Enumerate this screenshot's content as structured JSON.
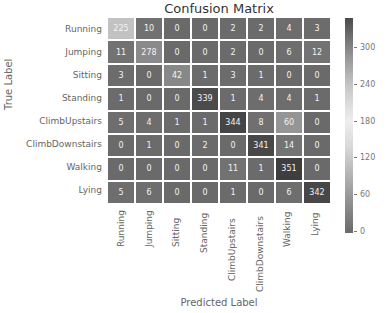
{
  "chart_data": {
    "type": "heatmap",
    "title": "Confusion Matrix",
    "xlabel": "Predicted Label",
    "ylabel": "True Label",
    "row_labels": [
      "Running",
      "Jumping",
      "Sitting",
      "Standing",
      "ClimbUpstairs",
      "ClimbDownstairs",
      "Walking",
      "Lying"
    ],
    "col_labels": [
      "Running",
      "Jumping",
      "Sitting",
      "Standing",
      "ClimbUpstairs",
      "ClimbDownstairs",
      "Walking",
      "Lying"
    ],
    "values": [
      [
        225,
        10,
        0,
        0,
        2,
        2,
        4,
        3
      ],
      [
        11,
        278,
        0,
        0,
        2,
        0,
        6,
        12
      ],
      [
        3,
        0,
        42,
        1,
        3,
        1,
        0,
        0
      ],
      [
        1,
        0,
        0,
        339,
        1,
        4,
        4,
        1
      ],
      [
        5,
        4,
        1,
        1,
        344,
        8,
        60,
        0
      ],
      [
        0,
        1,
        0,
        2,
        0,
        341,
        14,
        0
      ],
      [
        0,
        0,
        0,
        0,
        11,
        1,
        351,
        0
      ],
      [
        5,
        6,
        0,
        0,
        1,
        0,
        6,
        342
      ]
    ],
    "colorbar_ticks": [
      0,
      60,
      120,
      180,
      240,
      300
    ],
    "colorbar_range": [
      0,
      351
    ]
  }
}
